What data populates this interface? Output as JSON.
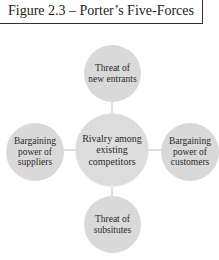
{
  "title": "Figure 2.3 – Porter’s Five-Forces",
  "diagram": {
    "type": "hub-and-spoke",
    "center": {
      "label": "Rivalry among existing competitors"
    },
    "nodes": {
      "top": {
        "label": "Threat of new entrants"
      },
      "left": {
        "label": "Bargaining power of suppliers"
      },
      "right": {
        "label": "Bargaining power of customers"
      },
      "bottom": {
        "label": "Threat of subsitutes"
      }
    },
    "colors": {
      "node_fill": "#d9d9d9",
      "connector": "#bfbfbf",
      "title_border": "#333333"
    }
  }
}
